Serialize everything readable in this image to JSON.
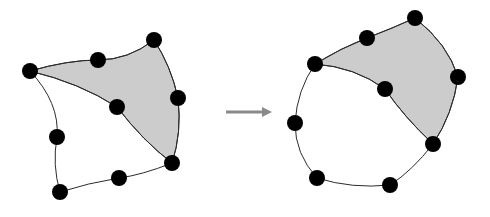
{
  "figure": {
    "background_color": "#ffffff",
    "width": 490,
    "height": 217,
    "shade_color": "#cccccc",
    "stroke_color": "#2b2b2b",
    "point_color": "#000000",
    "point_radius": 8,
    "arrow_color": "#8a8a8a"
  },
  "arrow": {
    "name": "transformation-arrow",
    "x1": 226,
    "y1": 112,
    "x2": 262,
    "y2": 112,
    "head_tip_x": 272,
    "head_half_height": 5,
    "color": "#8a8a8a",
    "label": ""
  },
  "left_patch": {
    "name": "source-patch",
    "corner_points": [
      {
        "id": "L-corner-west",
        "x": 30,
        "y": 71
      },
      {
        "id": "L-corner-north",
        "x": 154,
        "y": 40
      },
      {
        "id": "L-corner-east",
        "x": 172,
        "y": 163
      },
      {
        "id": "L-corner-south",
        "x": 60,
        "y": 192
      }
    ],
    "edge_points": [
      {
        "id": "L-edge-nw",
        "x": 98,
        "y": 60
      },
      {
        "id": "L-edge-ne",
        "x": 178,
        "y": 98
      },
      {
        "id": "L-edge-se",
        "x": 119,
        "y": 178
      },
      {
        "id": "L-edge-sw",
        "x": 57,
        "y": 137
      }
    ],
    "center_point": {
      "id": "L-center",
      "x": 117,
      "y": 107
    },
    "outline_path": "M 30 71 Q 68 60 98 60 Q 128 60 154 40 Q 171 66 178 98 Q 182 133 172 163 Q 142 175 119 178 Q 88 183 60 192 Q 52 165 57 137 Q 60 103 30 71 Z",
    "shaded_path": "M 30 71 Q 68 60 98 60 Q 128 60 154 40 Q 171 66 178 98 Q 182 133 172 163 Q 143 141 117 107 Q 80 83 30 71 Z",
    "interior_curve_1": "M 30 71 Q 80 83 117 107 Q 143 141 172 163",
    "shaded": true
  },
  "right_patch": {
    "name": "deformed-patch",
    "corner_points": [
      {
        "id": "R-corner-west",
        "x": 315,
        "y": 64
      },
      {
        "id": "R-corner-north",
        "x": 415,
        "y": 18
      },
      {
        "id": "R-corner-east",
        "x": 433,
        "y": 144
      },
      {
        "id": "R-corner-south",
        "x": 317,
        "y": 178
      }
    ],
    "edge_points": [
      {
        "id": "R-edge-nw",
        "x": 367,
        "y": 38
      },
      {
        "id": "R-edge-ne",
        "x": 458,
        "y": 77
      },
      {
        "id": "R-edge-se",
        "x": 390,
        "y": 185
      },
      {
        "id": "R-edge-sw",
        "x": 295,
        "y": 123
      }
    ],
    "center_point": {
      "id": "R-center",
      "x": 385,
      "y": 89
    },
    "outline_path": "M 315 64 Q 341 48 367 38 Q 393 28 415 18 Q 448 44 458 77 Q 453 114 433 144 Q 412 171 390 185 Q 352 189 317 178 Q 295 154 295 123 Q 297 90 315 64 Z",
    "shaded_path": "M 315 64 Q 341 48 367 38 Q 393 28 415 18 Q 448 44 458 77 Q 453 114 433 144 Q 404 117 385 89 Q 355 67 315 64 Z",
    "interior_curve_1": "M 315 64 Q 355 67 385 89 Q 404 117 433 144",
    "shaded": true
  }
}
